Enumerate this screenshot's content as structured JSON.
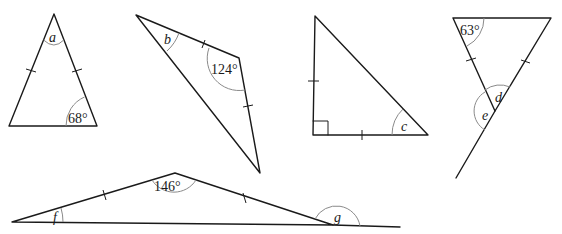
{
  "figures": {
    "t1": {
      "vertex_label": "a",
      "base_angle": "68°"
    },
    "t2": {
      "vertex_label": "b",
      "obtuse_angle": "124°"
    },
    "t3": {
      "vertex_label": "c"
    },
    "t4": {
      "top_angle": "63°",
      "interior_label": "d",
      "exterior_label": "e"
    },
    "t5": {
      "apex_angle": "146°",
      "base_label": "f",
      "exterior_label": "g"
    }
  }
}
